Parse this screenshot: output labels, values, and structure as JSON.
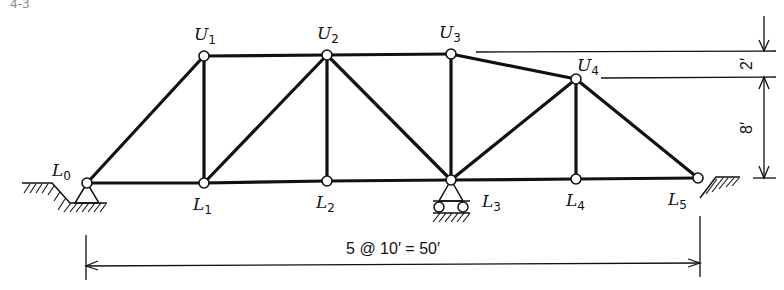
{
  "figure": {
    "corner_fragment": "4-3",
    "nodes": {
      "L0": {
        "label": "L",
        "sub": "0"
      },
      "L1": {
        "label": "L",
        "sub": "1"
      },
      "L2": {
        "label": "L",
        "sub": "2"
      },
      "L3": {
        "label": "L",
        "sub": "3"
      },
      "L4": {
        "label": "L",
        "sub": "4"
      },
      "L5": {
        "label": "L",
        "sub": "5"
      },
      "U1": {
        "label": "U",
        "sub": "1"
      },
      "U2": {
        "label": "U",
        "sub": "2"
      },
      "U3": {
        "label": "U",
        "sub": "3"
      },
      "U4": {
        "label": "U",
        "sub": "4"
      }
    },
    "dimensions": {
      "span": "5 @ 10′ = 50′",
      "upper_offset": "2′",
      "height": "8′"
    },
    "supports": {
      "L0": "pin",
      "L3": "roller",
      "L5": "free"
    },
    "members": [
      "L0-L1",
      "L1-L2",
      "L2-L3",
      "L3-L4",
      "L4-L5",
      "U1-U2",
      "U2-U3",
      "U3-U4",
      "L0-U1",
      "U1-L1",
      "L1-U2",
      "U2-L2",
      "U2-L3",
      "U3-L3",
      "L3-U4",
      "U4-L4",
      "U4-L5"
    ]
  }
}
